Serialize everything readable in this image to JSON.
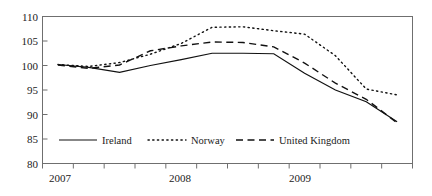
{
  "chart_data": {
    "type": "line",
    "title": "",
    "subtitle": "",
    "xlabel": "",
    "ylabel": "",
    "ylim": [
      80,
      110
    ],
    "y_ticks": [
      80,
      85,
      90,
      95,
      100,
      105,
      110
    ],
    "y_tick_labels": [
      "80",
      "85",
      "90",
      "95",
      "100",
      "105",
      "110"
    ],
    "x_tick_labels": [
      "2007",
      "2008",
      "2009"
    ],
    "x_tick_label_positions": [
      0,
      4,
      8
    ],
    "x_minor_tick_count": 12,
    "x": [
      "2007Q1",
      "2007Q2",
      "2007Q3",
      "2007Q4",
      "2008Q1",
      "2008Q2",
      "2008Q3",
      "2008Q4",
      "2009Q1",
      "2009Q2",
      "2009Q3",
      "2009Q4"
    ],
    "grid": false,
    "legend_position": "bottom-center",
    "series": [
      {
        "name": "Ireland",
        "style": "solid",
        "color": "#111111",
        "values": [
          100.2,
          99.6,
          98.6,
          100.0,
          101.2,
          102.5,
          102.5,
          102.4,
          98.4,
          95.0,
          92.6,
          88.5
        ]
      },
      {
        "name": "Norway",
        "style": "dotted",
        "color": "#111111",
        "values": [
          100.2,
          99.8,
          100.6,
          102.3,
          104.5,
          107.8,
          107.9,
          107.1,
          106.4,
          102.0,
          95.2,
          94.0
        ]
      },
      {
        "name": "United Kingdom",
        "style": "dashed",
        "color": "#111111",
        "values": [
          100.1,
          99.4,
          100.1,
          103.0,
          104.0,
          104.8,
          104.7,
          103.8,
          100.5,
          96.4,
          93.1,
          88.3
        ]
      }
    ]
  },
  "legend": {
    "items": [
      {
        "label": "Ireland",
        "style": "solid"
      },
      {
        "label": "Norway",
        "style": "dotted"
      },
      {
        "label": "United Kingdom",
        "style": "dashed"
      }
    ]
  },
  "axes": {
    "y_labels": [
      "110",
      "105",
      "100",
      "95",
      "90",
      "85",
      "80"
    ],
    "x_labels": [
      "2007",
      "2008",
      "2009"
    ]
  },
  "colors": {
    "series": "#111111",
    "frame": "#6f6f6f",
    "text": "#1a1a1a",
    "background": "#ffffff"
  }
}
